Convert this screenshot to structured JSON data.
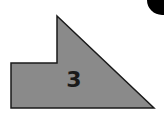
{
  "diagram": {
    "shape": {
      "kind": "polygon",
      "description": "L-step shape with diagonal hypotenuse",
      "label": "3",
      "fill": "#8a8a8a",
      "stroke": "#1a1a1a",
      "points": "57,16 154,108 11,108 11,63 57,63"
    },
    "corner_marker": {
      "kind": "circle",
      "fill": "#000000",
      "cx": 162,
      "cy": 0,
      "r": 15
    }
  }
}
